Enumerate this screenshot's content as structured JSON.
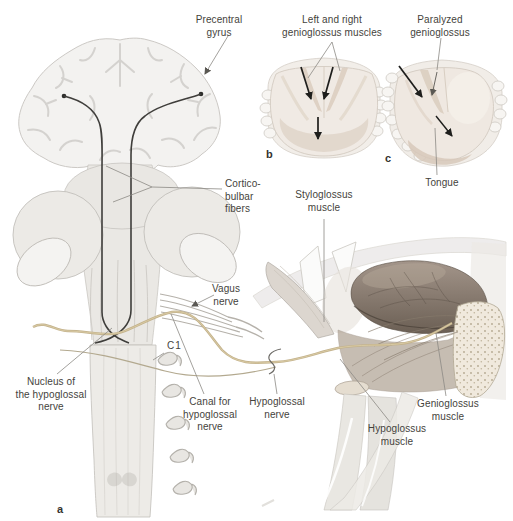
{
  "figure_title": "Hypoglossal nerve pathway with genioglossus function",
  "panels": {
    "a": "a",
    "b": "b",
    "c": "c"
  },
  "labels": {
    "precentral_gyrus": "Precentral\ngyrus",
    "left_right_genioglossus": "Left and right\ngenioglossus muscles",
    "paralyzed_genioglossus": "Paralyzed\ngenioglossus",
    "corticobulbar_fibers": "Cortico-\nbulbar\nfibers",
    "styloglossus_muscle": "Styloglossus\nmuscle",
    "vagus_nerve": "Vagus\nnerve",
    "c1": "C1",
    "nucleus_hypoglossal": "Nucleus of\nthe hypoglossal\nnerve",
    "canal_hypoglossal": "Canal for\nhypoglossal\nnerve",
    "hypoglossal_nerve": "Hypoglossal\nnerve",
    "tongue": "Tongue",
    "genioglossus_muscle": "Genioglossus muscle",
    "hypoglossus_muscle": "Hypoglossus\nmuscle"
  },
  "colors": {
    "text": "#45433c",
    "leader_line": "#8b8984",
    "fiber_black": "#3f3e3b",
    "arrow_black": "#1e1e1c",
    "nerve_tan": "#c3b28c",
    "tongue_brown": "#8a7c6e",
    "tissue_pale": "#eceae6",
    "background": "#ffffff"
  }
}
